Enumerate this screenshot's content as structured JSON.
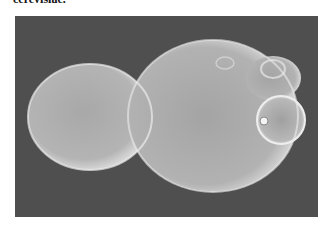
{
  "caption": {
    "text": "cerevisiae."
  },
  "figure": {
    "background_color": "#4f4f4f",
    "cell_color": "#c9c9c9"
  }
}
